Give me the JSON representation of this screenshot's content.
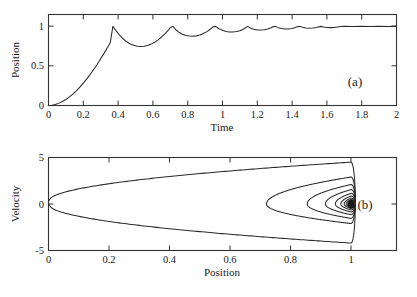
{
  "figure": {
    "background": "#ffffff",
    "ink_color": "#2a2a2a",
    "panels": [
      {
        "id": "a",
        "label": "(a)",
        "xlabel": "Time",
        "ylabel": "Position"
      },
      {
        "id": "b",
        "label": "(b)",
        "xlabel": "Position",
        "ylabel": "Velocity"
      }
    ]
  },
  "chart_data": [
    {
      "type": "line",
      "id": "panel-a",
      "title": "",
      "panel_label": "(a)",
      "xlabel": "Time",
      "ylabel": "Position",
      "xlim": [
        0,
        2
      ],
      "ylim": [
        0,
        1.15
      ],
      "xticks": [
        0,
        0.2,
        0.4,
        0.6,
        0.8,
        1,
        1.2,
        1.4,
        1.6,
        1.8,
        2
      ],
      "xticklabels": [
        "0",
        "0.2",
        "0.4",
        "0.6",
        "0.8",
        "1",
        "1.2",
        "1.4",
        "1.6",
        "1.8",
        "2"
      ],
      "yticks": [
        0,
        0.5,
        1
      ],
      "yticklabels": [
        "0",
        "0.5",
        "1"
      ],
      "grid": false,
      "legend": "none",
      "description": "Damped bouncing oscillation rising from 0 to steady state 1 with cusped peaks at y=1 and rounded troughs of decreasing depth.",
      "series": [
        {
          "name": "position",
          "x": [
            0.0,
            0.02,
            0.04,
            0.06,
            0.08,
            0.1,
            0.12,
            0.14,
            0.16,
            0.18,
            0.2,
            0.22,
            0.24,
            0.26,
            0.28,
            0.3,
            0.32,
            0.34,
            0.355,
            0.37,
            0.39,
            0.41,
            0.43,
            0.45,
            0.47,
            0.49,
            0.51,
            0.53,
            0.55,
            0.57,
            0.59,
            0.61,
            0.63,
            0.65,
            0.67,
            0.69,
            0.7,
            0.715,
            0.73,
            0.75,
            0.77,
            0.79,
            0.81,
            0.83,
            0.85,
            0.87,
            0.89,
            0.91,
            0.93,
            0.945,
            0.96,
            0.98,
            1.0,
            1.02,
            1.04,
            1.06,
            1.08,
            1.1,
            1.12,
            1.13,
            1.145,
            1.16,
            1.18,
            1.2,
            1.22,
            1.24,
            1.26,
            1.28,
            1.29,
            1.305,
            1.32,
            1.34,
            1.36,
            1.38,
            1.4,
            1.42,
            1.43,
            1.445,
            1.46,
            1.48,
            1.5,
            1.52,
            1.54,
            1.55,
            1.565,
            1.58,
            1.6,
            1.62,
            1.64,
            1.66,
            1.68,
            1.7,
            1.75,
            1.8,
            1.85,
            1.9,
            1.95,
            2.0
          ],
          "y": [
            0.0,
            0.004,
            0.014,
            0.03,
            0.05,
            0.076,
            0.108,
            0.145,
            0.186,
            0.232,
            0.282,
            0.336,
            0.394,
            0.456,
            0.521,
            0.59,
            0.662,
            0.737,
            0.795,
            1.0,
            0.94,
            0.885,
            0.84,
            0.805,
            0.778,
            0.76,
            0.749,
            0.745,
            0.748,
            0.759,
            0.776,
            0.8,
            0.83,
            0.866,
            0.908,
            0.955,
            0.985,
            1.0,
            0.96,
            0.925,
            0.9,
            0.885,
            0.877,
            0.875,
            0.88,
            0.892,
            0.91,
            0.934,
            0.963,
            0.995,
            1.0,
            0.97,
            0.95,
            0.935,
            0.928,
            0.928,
            0.934,
            0.946,
            0.964,
            0.98,
            1.0,
            0.978,
            0.963,
            0.955,
            0.953,
            0.957,
            0.967,
            0.982,
            0.995,
            1.0,
            0.984,
            0.973,
            0.968,
            0.968,
            0.974,
            0.985,
            0.995,
            1.0,
            0.988,
            0.98,
            0.977,
            0.979,
            0.986,
            0.993,
            1.0,
            0.992,
            0.986,
            0.984,
            0.987,
            0.993,
            0.998,
            1.0,
            0.998,
            1.0,
            0.999,
            1.0,
            0.999,
            1.0
          ]
        }
      ]
    },
    {
      "type": "line",
      "id": "panel-b",
      "title": "",
      "panel_label": "(b)",
      "xlabel": "Position",
      "ylabel": "Velocity",
      "xlim": [
        0,
        1.15
      ],
      "ylim": [
        -5,
        5
      ],
      "xticks": [
        0,
        0.2,
        0.4,
        0.6,
        0.8,
        1
      ],
      "xticklabels": [
        "0",
        "0.2",
        "0.4",
        "0.6",
        "0.8",
        "1"
      ],
      "yticks": [
        -5,
        0,
        5
      ],
      "yticklabels": [
        "-5",
        "0",
        "5"
      ],
      "grid": false,
      "legend": "none",
      "description": "Phase portrait: trajectory launches from (0, 0.3), rises to velocity ~4.5 near position 1, then follows nested inward-spiralling parabola-like loops converging on a dark fixed point at (1, 0).",
      "fixed_point": [
        1.0,
        0.0
      ],
      "loops": [
        {
          "name": "outer-launch",
          "x_left": 0.0,
          "v_start": 0.3,
          "v_peak": 4.5,
          "v_min": -4.2
        },
        {
          "name": "loop-2",
          "x_left": 0.72,
          "v_peak": 2.9,
          "v_min": -2.1
        },
        {
          "name": "loop-3",
          "x_left": 0.855,
          "v_peak": 2.1,
          "v_min": -1.55
        },
        {
          "name": "loop-4",
          "x_left": 0.915,
          "v_peak": 1.55,
          "v_min": -1.15
        },
        {
          "name": "loop-5",
          "x_left": 0.948,
          "v_peak": 1.15,
          "v_min": -0.86
        },
        {
          "name": "loop-6",
          "x_left": 0.966,
          "v_peak": 0.86,
          "v_min": -0.64
        },
        {
          "name": "loop-7",
          "x_left": 0.977,
          "v_peak": 0.64,
          "v_min": -0.48
        },
        {
          "name": "loop-8",
          "x_left": 0.984,
          "v_peak": 0.48,
          "v_min": -0.36
        },
        {
          "name": "loop-9",
          "x_left": 0.989,
          "v_peak": 0.36,
          "v_min": -0.27
        },
        {
          "name": "loop-10",
          "x_left": 0.992,
          "v_peak": 0.27,
          "v_min": -0.2
        }
      ]
    }
  ]
}
